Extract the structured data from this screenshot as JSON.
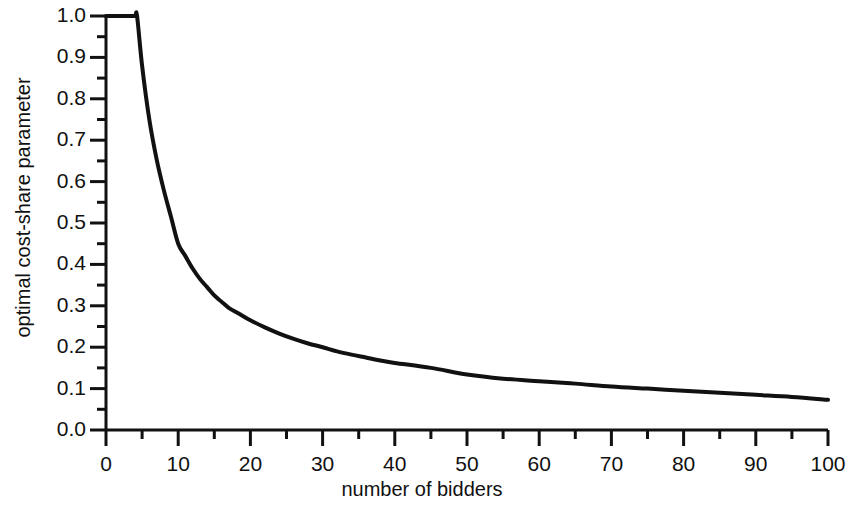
{
  "chart_data": {
    "type": "line",
    "title": "",
    "subtitle": "",
    "xlabel": "number of bidders",
    "ylabel": "optimal cost-share parameter",
    "xlim": [
      0,
      100
    ],
    "ylim": [
      0.0,
      1.0
    ],
    "grid": false,
    "legend": null,
    "legend_position": "none",
    "xticks": [
      0,
      10,
      20,
      30,
      40,
      50,
      60,
      70,
      80,
      90,
      100
    ],
    "xtick_labels": [
      "0",
      "10",
      "20",
      "30",
      "40",
      "50",
      "60",
      "70",
      "80",
      "90",
      "100"
    ],
    "x_minor_tick_interval": 5,
    "yticks": [
      0.0,
      0.1,
      0.2,
      0.3,
      0.4,
      0.5,
      0.6,
      0.7,
      0.8,
      0.9,
      1.0
    ],
    "ytick_labels": [
      "0.0",
      "0.1",
      "0.2",
      "0.3",
      "0.4",
      "0.5",
      "0.6",
      "0.7",
      "0.8",
      "0.9",
      "1.0"
    ],
    "y_minor_tick_interval": 0.05,
    "line_color": "#111111",
    "line_width": 4,
    "series": [
      {
        "name": "optimal cost-share parameter",
        "x": [
          0,
          1,
          2,
          3,
          4,
          4.3,
          5,
          6,
          7,
          8,
          9,
          10,
          11,
          12,
          13,
          14,
          15,
          16,
          17,
          18,
          19,
          20,
          22,
          24,
          26,
          28,
          30,
          32,
          34,
          36,
          38,
          40,
          45,
          50,
          55,
          60,
          65,
          70,
          75,
          80,
          85,
          90,
          95,
          100
        ],
        "values": [
          1.0,
          1.0,
          1.0,
          1.0,
          1.0,
          1.0,
          0.88,
          0.75,
          0.655,
          0.58,
          0.515,
          0.45,
          0.42,
          0.39,
          0.365,
          0.345,
          0.325,
          0.31,
          0.295,
          0.285,
          0.275,
          0.265,
          0.248,
          0.233,
          0.22,
          0.209,
          0.2,
          0.19,
          0.182,
          0.175,
          0.168,
          0.162,
          0.15,
          0.134,
          0.124,
          0.118,
          0.112,
          0.105,
          0.1,
          0.095,
          0.09,
          0.085,
          0.08,
          0.073
        ]
      }
    ],
    "annotations": []
  },
  "axes": {
    "y_axis_label": "optimal cost-share parameter",
    "x_axis_label": "number of bidders"
  }
}
